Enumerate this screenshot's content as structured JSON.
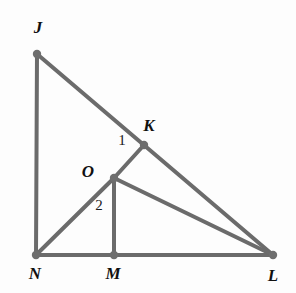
{
  "figure": {
    "kind": "geometry-diagram",
    "width": 296,
    "height": 293,
    "background_color": "#fdfdfd",
    "stroke_color": "#6b6b6b",
    "vertex_dot_color": "#6e6e6e",
    "label_color": "#111111",
    "stroke_width": 4
  },
  "points": [
    {
      "id": "J",
      "label": "J",
      "x": 37,
      "y": 54,
      "label_x": 38,
      "label_y": 27,
      "dot": true
    },
    {
      "id": "K",
      "label": "K",
      "x": 144,
      "y": 145,
      "label_x": 149,
      "label_y": 125,
      "dot": true
    },
    {
      "id": "O",
      "label": "O",
      "x": 114,
      "y": 178,
      "label_x": 88,
      "label_y": 171,
      "dot": true
    },
    {
      "id": "N",
      "label": "N",
      "x": 36,
      "y": 255,
      "label_x": 35,
      "label_y": 273,
      "dot": true
    },
    {
      "id": "M",
      "label": "M",
      "x": 114,
      "y": 255,
      "label_x": 113,
      "label_y": 273,
      "dot": true
    },
    {
      "id": "L",
      "label": "L",
      "x": 273,
      "y": 255,
      "label_x": 273,
      "label_y": 275,
      "dot": true
    }
  ],
  "segments": [
    {
      "id": "JN",
      "from": "J",
      "to": "N",
      "x1": 37,
      "y1": 54,
      "x2": 36,
      "y2": 255
    },
    {
      "id": "JL",
      "from": "J",
      "to": "L",
      "x1": 37,
      "y1": 54,
      "x2": 273,
      "y2": 255
    },
    {
      "id": "NL",
      "from": "N",
      "to": "L",
      "x1": 36,
      "y1": 255,
      "x2": 273,
      "y2": 255
    },
    {
      "id": "KO",
      "from": "K",
      "to": "O",
      "x1": 144,
      "y1": 145,
      "x2": 114,
      "y2": 178
    },
    {
      "id": "ON",
      "from": "O",
      "to": "N",
      "x1": 114,
      "y1": 178,
      "x2": 36,
      "y2": 255
    },
    {
      "id": "OM",
      "from": "O",
      "to": "M",
      "x1": 114,
      "y1": 178,
      "x2": 114,
      "y2": 255
    },
    {
      "id": "OL",
      "from": "O",
      "to": "L",
      "x1": 114,
      "y1": 178,
      "x2": 273,
      "y2": 255
    }
  ],
  "angle_labels": [
    {
      "id": "angle-1",
      "label": "1",
      "x": 122,
      "y": 140
    },
    {
      "id": "angle-2",
      "label": "2",
      "x": 99,
      "y": 205
    }
  ]
}
